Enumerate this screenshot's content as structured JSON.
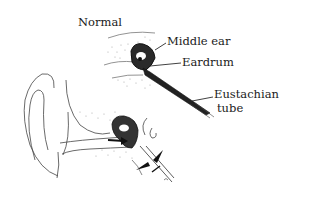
{
  "figure": {
    "labels": {
      "normal": "Normal",
      "middle_ear": "Middle ear",
      "eardrum": "Eardrum",
      "eustachian_line1": "Eustachian",
      "eustachian_line2": "tube"
    },
    "panels": [
      {
        "name": "normal-view",
        "description": "Cross-section showing open Eustachian tube"
      },
      {
        "name": "blocked-view",
        "description": "Outer ear with ear canal, eardrum pressure arrow, and pinched Eustachian tube"
      }
    ],
    "colors": {
      "ink": "#1a1a1a",
      "stipple": "#9a9a9a",
      "background": "#ffffff"
    }
  }
}
